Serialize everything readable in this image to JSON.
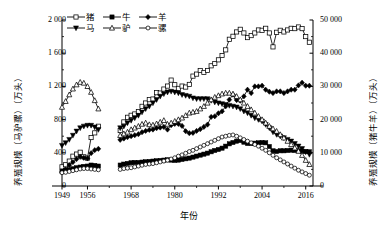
{
  "axes": {
    "y_left_title": "养殖规模（马驴骡）（万头）",
    "y_right_title": "养殖规模（猪牛羊）（万头）",
    "x_title": "年份",
    "y_left_ticks": [
      "0",
      "400",
      "800",
      "1 200",
      "1 600",
      "2 000"
    ],
    "y_right_ticks": [
      "0",
      "10 000",
      "20 000",
      "30 000",
      "40 000",
      "50 000"
    ],
    "x_ticks": [
      "1949",
      "1956",
      "1968",
      "1980",
      "1992",
      "2004",
      "2016"
    ]
  },
  "legend": {
    "rows": [
      [
        {
          "label": "猪",
          "marker": "open-square"
        },
        {
          "label": "牛",
          "marker": "filled-square"
        },
        {
          "label": "羊",
          "marker": "filled-diamond"
        }
      ],
      [
        {
          "label": "马",
          "marker": "filled-triangle-down"
        },
        {
          "label": "驴",
          "marker": "open-triangle-up"
        },
        {
          "label": "骡",
          "marker": "open-circle"
        }
      ]
    ]
  },
  "chart_data": {
    "type": "line",
    "title": "",
    "xlabel": "年份",
    "ylabel": "养殖规模（马驴骡）（万头）",
    "ylabel_right": "养殖规模（猪牛羊）（万头）",
    "xlim": [
      1949,
      2018
    ],
    "ylim_left": [
      0,
      2000
    ],
    "ylim_right": [
      0,
      50000
    ],
    "grid": false,
    "legend_position": "top-left",
    "x_tick_values": [
      1949,
      1956,
      1968,
      1980,
      1992,
      2004,
      2016
    ],
    "data_gap_years": [
      1960,
      1961,
      1962,
      1963,
      1964
    ],
    "series": [
      {
        "name": "猪",
        "name_en": "pig",
        "axis": "right",
        "marker": "open-square",
        "x": [
          1949,
          1950,
          1951,
          1952,
          1953,
          1954,
          1955,
          1956,
          1957,
          1958,
          1959,
          1965,
          1966,
          1967,
          1968,
          1969,
          1970,
          1971,
          1972,
          1973,
          1974,
          1975,
          1976,
          1977,
          1978,
          1979,
          1980,
          1981,
          1982,
          1983,
          1984,
          1985,
          1986,
          1987,
          1988,
          1989,
          1990,
          1991,
          1992,
          1993,
          1994,
          1995,
          1996,
          1997,
          1998,
          1999,
          2000,
          2001,
          2002,
          2003,
          2004,
          2005,
          2006,
          2007,
          2008,
          2009,
          2010,
          2011,
          2012,
          2013,
          2014,
          2015,
          2016,
          2017
        ],
        "values": [
          5775,
          6400,
          7500,
          8980,
          9610,
          10170,
          8790,
          8400,
          14590,
          16000,
          18000,
          16700,
          19300,
          20700,
          21300,
          21700,
          22400,
          24000,
          25000,
          26000,
          26200,
          28100,
          28000,
          29200,
          30100,
          31900,
          30500,
          29400,
          30100,
          29800,
          30600,
          33100,
          33700,
          34800,
          34200,
          34800,
          36200,
          36900,
          38000,
          39300,
          41000,
          44200,
          45100,
          46400,
          47200,
          46100,
          44700,
          45300,
          46100,
          47000,
          46900,
          47500,
          46100,
          41900,
          46300,
          46900,
          46400,
          47000,
          47500,
          47400,
          47900,
          47400,
          45000,
          43300
        ]
      },
      {
        "name": "牛",
        "name_en": "cattle",
        "axis": "right",
        "marker": "filled-square",
        "x": [
          1949,
          1950,
          1951,
          1952,
          1953,
          1954,
          1955,
          1956,
          1957,
          1958,
          1959,
          1965,
          1966,
          1967,
          1968,
          1969,
          1970,
          1971,
          1972,
          1973,
          1974,
          1975,
          1976,
          1977,
          1978,
          1979,
          1980,
          1981,
          1982,
          1983,
          1984,
          1985,
          1986,
          1987,
          1988,
          1989,
          1990,
          1991,
          1992,
          1993,
          1994,
          1995,
          1996,
          1997,
          1998,
          1999,
          2000,
          2001,
          2002,
          2003,
          2004,
          2005,
          2006,
          2007,
          2008,
          2009,
          2010,
          2011,
          2012,
          2013,
          2014,
          2015,
          2016,
          2017
        ],
        "values": [
          4400,
          4700,
          4900,
          5200,
          5500,
          5700,
          5900,
          6000,
          6300,
          6200,
          6000,
          6300,
          6600,
          6800,
          7000,
          7100,
          7100,
          7200,
          7300,
          7400,
          7500,
          7600,
          7700,
          7800,
          7900,
          7800,
          7700,
          7800,
          8000,
          8200,
          8400,
          8700,
          9000,
          9300,
          9600,
          9900,
          10300,
          10700,
          11000,
          11400,
          12000,
          12700,
          13100,
          13500,
          13700,
          13200,
          12800,
          12800,
          12900,
          13000,
          13100,
          13000,
          11900,
          10600,
          10400,
          10600,
          10600,
          10700,
          10800,
          10700,
          10600,
          10500,
          10400,
          10300
        ]
      },
      {
        "name": "羊",
        "name_en": "sheep & goat",
        "axis": "right",
        "marker": "filled-diamond",
        "x": [
          1949,
          1950,
          1951,
          1952,
          1953,
          1954,
          1955,
          1956,
          1957,
          1958,
          1959,
          1965,
          1966,
          1967,
          1968,
          1969,
          1970,
          1971,
          1972,
          1973,
          1974,
          1975,
          1976,
          1977,
          1978,
          1979,
          1980,
          1981,
          1982,
          1983,
          1984,
          1985,
          1986,
          1987,
          1988,
          1989,
          1990,
          1991,
          1992,
          1993,
          1994,
          1995,
          1996,
          1997,
          1998,
          1999,
          2000,
          2001,
          2002,
          2003,
          2004,
          2005,
          2006,
          2007,
          2008,
          2009,
          2010,
          2011,
          2012,
          2013,
          2014,
          2015,
          2016,
          2017
        ],
        "values": [
          4230,
          5000,
          6300,
          7200,
          8100,
          8800,
          8500,
          8300,
          9900,
          10800,
          11200,
          13900,
          14300,
          14700,
          15000,
          15300,
          15600,
          16200,
          16600,
          16900,
          17000,
          17400,
          17600,
          17800,
          17000,
          18300,
          18700,
          18700,
          18100,
          16500,
          15900,
          16000,
          16600,
          17100,
          17800,
          18500,
          20800,
          21000,
          21900,
          22500,
          24000,
          26000,
          27500,
          25900,
          25700,
          27000,
          29000,
          28000,
          30000,
          30000,
          30200,
          29000,
          28400,
          28000,
          28500,
          28500,
          28000,
          28500,
          29000,
          29000,
          30300,
          31100,
          30200,
          30200
        ]
      },
      {
        "name": "马",
        "name_en": "horse",
        "axis": "left",
        "marker": "filled-triangle-down",
        "x": [
          1949,
          1950,
          1951,
          1952,
          1953,
          1954,
          1955,
          1956,
          1957,
          1958,
          1959,
          1965,
          1966,
          1967,
          1968,
          1969,
          1970,
          1971,
          1972,
          1973,
          1974,
          1975,
          1976,
          1977,
          1978,
          1979,
          1980,
          1981,
          1982,
          1983,
          1984,
          1985,
          1986,
          1987,
          1988,
          1989,
          1990,
          1991,
          1992,
          1993,
          1994,
          1995,
          1996,
          1997,
          1998,
          1999,
          2000,
          2001,
          2002,
          2003,
          2004,
          2005,
          2006,
          2007,
          2008,
          2009,
          2010,
          2011,
          2012,
          2013,
          2014,
          2015,
          2016,
          2017
        ],
        "values": [
          488,
          520,
          560,
          610,
          660,
          700,
          720,
          730,
          730,
          710,
          680,
          700,
          720,
          760,
          790,
          820,
          850,
          890,
          930,
          960,
          1000,
          1040,
          1080,
          1110,
          1130,
          1140,
          1130,
          1120,
          1100,
          1090,
          1080,
          1060,
          1050,
          1050,
          1050,
          1050,
          1030,
          1010,
          1000,
          990,
          980,
          970,
          960,
          950,
          930,
          900,
          880,
          850,
          820,
          800,
          780,
          740,
          700,
          650,
          620,
          600,
          580,
          560,
          540,
          510,
          480,
          450,
          410,
          380
        ]
      },
      {
        "name": "驴",
        "name_en": "donkey",
        "axis": "left",
        "marker": "open-triangle-up",
        "x": [
          1949,
          1950,
          1951,
          1952,
          1953,
          1954,
          1955,
          1956,
          1957,
          1958,
          1959,
          1965,
          1966,
          1967,
          1968,
          1969,
          1970,
          1971,
          1972,
          1973,
          1974,
          1975,
          1976,
          1977,
          1978,
          1979,
          1980,
          1981,
          1982,
          1983,
          1984,
          1985,
          1986,
          1987,
          1988,
          1989,
          1990,
          1991,
          1992,
          1993,
          1994,
          1995,
          1996,
          1997,
          1998,
          1999,
          2000,
          2001,
          2002,
          2003,
          2004,
          2005,
          2006,
          2007,
          2008,
          2009,
          2010,
          2011,
          2012,
          2013,
          2014,
          2015,
          2016,
          2017
        ],
        "values": [
          950,
          1020,
          1100,
          1170,
          1220,
          1250,
          1240,
          1200,
          1130,
          1030,
          930,
          610,
          630,
          650,
          680,
          700,
          720,
          745,
          760,
          740,
          735,
          750,
          770,
          790,
          745,
          760,
          780,
          800,
          820,
          850,
          880,
          890,
          900,
          930,
          960,
          1000,
          1040,
          1070,
          1090,
          1110,
          1120,
          1120,
          1110,
          1080,
          1040,
          1000,
          960,
          920,
          880,
          840,
          800,
          760,
          720,
          690,
          660,
          620,
          580,
          540,
          500,
          460,
          420,
          370,
          310,
          260
        ]
      },
      {
        "name": "骡",
        "name_en": "mule",
        "axis": "left",
        "marker": "open-circle",
        "x": [
          1949,
          1950,
          1951,
          1952,
          1953,
          1954,
          1955,
          1956,
          1957,
          1958,
          1959,
          1965,
          1966,
          1967,
          1968,
          1969,
          1970,
          1971,
          1972,
          1973,
          1974,
          1975,
          1976,
          1977,
          1978,
          1979,
          1980,
          1981,
          1982,
          1983,
          1984,
          1985,
          1986,
          1987,
          1988,
          1989,
          1990,
          1991,
          1992,
          1993,
          1994,
          1995,
          1996,
          1997,
          1998,
          1999,
          2000,
          2001,
          2002,
          2003,
          2004,
          2005,
          2006,
          2007,
          2008,
          2009,
          2010,
          2011,
          2012,
          2013,
          2014,
          2015,
          2016,
          2017
        ],
        "values": [
          160,
          165,
          175,
          185,
          195,
          205,
          210,
          210,
          205,
          200,
          195,
          200,
          210,
          215,
          220,
          230,
          240,
          250,
          260,
          265,
          270,
          280,
          290,
          300,
          310,
          325,
          340,
          360,
          375,
          395,
          415,
          430,
          450,
          470,
          490,
          510,
          530,
          550,
          570,
          590,
          600,
          610,
          615,
          600,
          580,
          560,
          540,
          520,
          500,
          480,
          455,
          430,
          400,
          370,
          340,
          315,
          290,
          265,
          240,
          215,
          190,
          170,
          150,
          130
        ]
      }
    ]
  }
}
